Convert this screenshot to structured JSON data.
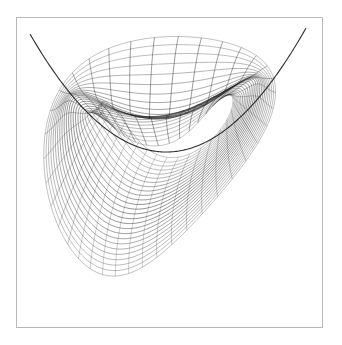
{
  "figure": {
    "kind": "mathematical-line-art",
    "background_color": "#ffffff",
    "line_color": "#1a1a1a",
    "frame_color": "#b8b8b8",
    "canvas": {
      "width": 342,
      "height": 345
    },
    "frame": {
      "x": 16,
      "y": 17,
      "width": 306,
      "height": 310
    },
    "plot_area": {
      "x": 16,
      "y": 17,
      "width": 306,
      "height": 310
    },
    "convergence_points": [
      {
        "name": "upper-left-cusp",
        "x": 32,
        "y": 31
      },
      {
        "name": "upper-right-cusp",
        "x": 313,
        "y": 26
      },
      {
        "name": "lower-left-cusp",
        "x": 57,
        "y": 312
      },
      {
        "name": "lower-right-cusp",
        "x": 221,
        "y": 226
      },
      {
        "name": "central-node",
        "x": 166,
        "y": 160
      }
    ],
    "envelope": {
      "name": "parabolic-envelope",
      "vertex": {
        "x": 168,
        "y": 152
      },
      "left_end": {
        "x": 34,
        "y": 34
      },
      "right_end": {
        "x": 310,
        "y": 28
      }
    },
    "grid": {
      "radial_line_count": 37,
      "arc_line_count": 26,
      "radius_min": 0.1,
      "radius_max": 1.0,
      "angle_start_deg": 0,
      "angle_end_deg": 360
    },
    "mapping": {
      "type": "z_squared_plus_linear",
      "center": {
        "x": 168,
        "y": 150
      },
      "scale_x": 150,
      "scale_y": 150,
      "shear": -0.55,
      "rotation_deg": 0
    },
    "stroke": {
      "base_width": 0.38,
      "dense_width": 0.5,
      "min_opacity": 0.3,
      "max_opacity": 0.95
    }
  }
}
